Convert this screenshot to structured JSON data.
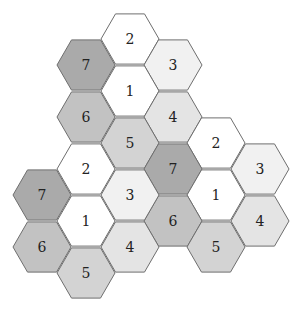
{
  "diagram": {
    "title": "",
    "hex_radius": 29,
    "shade_by_value": {
      "1": "#ffffff",
      "2": "#ffffff",
      "3": "#f1f1f1",
      "4": "#e4e4e4",
      "5": "#d3d3d3",
      "6": "#c2c2c2",
      "7": "#aaaaaa"
    },
    "clusters": [
      {
        "name": "top-cluster",
        "hexes": [
          {
            "label": "2",
            "cx": 130,
            "cy": 39
          },
          {
            "label": "7",
            "cx": 86,
            "cy": 65
          },
          {
            "label": "3",
            "cx": 173,
            "cy": 65
          },
          {
            "label": "1",
            "cx": 130,
            "cy": 91
          },
          {
            "label": "6",
            "cx": 86,
            "cy": 117
          },
          {
            "label": "4",
            "cx": 173,
            "cy": 117
          },
          {
            "label": "5",
            "cx": 130,
            "cy": 143
          }
        ]
      },
      {
        "name": "right-cluster",
        "hexes": [
          {
            "label": "2",
            "cx": 216,
            "cy": 143
          },
          {
            "label": "7",
            "cx": 173,
            "cy": 169
          },
          {
            "label": "3",
            "cx": 260,
            "cy": 169
          },
          {
            "label": "1",
            "cx": 216,
            "cy": 195
          },
          {
            "label": "6",
            "cx": 173,
            "cy": 221
          },
          {
            "label": "4",
            "cx": 260,
            "cy": 221
          },
          {
            "label": "5",
            "cx": 216,
            "cy": 247
          }
        ]
      },
      {
        "name": "left-cluster",
        "hexes": [
          {
            "label": "2",
            "cx": 86,
            "cy": 169
          },
          {
            "label": "7",
            "cx": 42,
            "cy": 195
          },
          {
            "label": "3",
            "cx": 130,
            "cy": 195
          },
          {
            "label": "1",
            "cx": 86,
            "cy": 221
          },
          {
            "label": "6",
            "cx": 42,
            "cy": 247
          },
          {
            "label": "4",
            "cx": 130,
            "cy": 247
          },
          {
            "label": "5",
            "cx": 86,
            "cy": 273
          }
        ]
      }
    ]
  }
}
